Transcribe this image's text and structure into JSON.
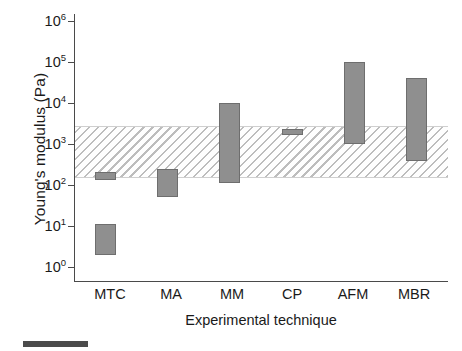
{
  "chart_data": {
    "type": "bar",
    "subtype": "floating-range-bar",
    "title": "",
    "xlabel": "Experimental technique",
    "ylabel": "Young's modulus (Pa)",
    "yscale": "log",
    "ylim": [
      1,
      1000000
    ],
    "ytick_values": [
      1,
      10,
      100,
      1000,
      10000,
      100000,
      1000000
    ],
    "ytick_labels": [
      "10",
      "10",
      "10",
      "10",
      "10",
      "10",
      "10"
    ],
    "ytick_exponents": [
      "0",
      "1",
      "2",
      "3",
      "4",
      "5",
      "6"
    ],
    "grid": false,
    "legend": "none",
    "categories": [
      "MTC",
      "MA",
      "MM",
      "CP",
      "AFM",
      "MBR"
    ],
    "ranges": [
      {
        "category": "MTC",
        "segments": [
          {
            "low": 130,
            "high": 210
          },
          {
            "low": 2,
            "high": 11
          }
        ]
      },
      {
        "category": "MA",
        "segments": [
          {
            "low": 50,
            "high": 250
          }
        ]
      },
      {
        "category": "MM",
        "segments": [
          {
            "low": 110,
            "high": 10000
          }
        ]
      },
      {
        "category": "CP",
        "segments": [
          {
            "low": 1700,
            "high": 2300
          }
        ]
      },
      {
        "category": "AFM",
        "segments": [
          {
            "low": 1000,
            "high": 100000
          }
        ]
      },
      {
        "category": "MBR",
        "segments": [
          {
            "low": 380,
            "high": 40000
          }
        ]
      }
    ],
    "reference_band": {
      "label": "shaded reference range",
      "low": 150,
      "high": 2800,
      "style": "diagonal-hatch"
    },
    "colors": {
      "bar_fill": "#8f8f8f",
      "bar_stroke": "#6e6e6e",
      "axis": "#4a4a4a",
      "hatch": "#bdbdbd",
      "text": "#1a1a1a"
    }
  }
}
